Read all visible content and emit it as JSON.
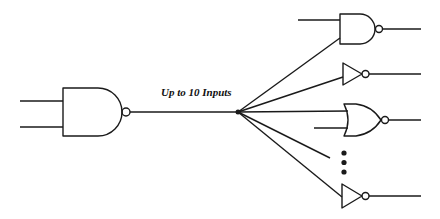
{
  "diagram": {
    "type": "logic-fanout",
    "label": "Up to 10 Inputs",
    "stroke_color": "#1a1a1a",
    "source_gate": {
      "kind": "NAND",
      "inputs": 2
    },
    "fanout_node": {
      "x": 238,
      "y": 112
    },
    "targets": [
      {
        "kind": "NAND",
        "inputs": 2
      },
      {
        "kind": "NOT",
        "inputs": 1
      },
      {
        "kind": "NOR",
        "inputs": 2
      },
      {
        "kind": "ellipsis",
        "symbol": "⋮"
      },
      {
        "kind": "NOT",
        "inputs": 1
      }
    ]
  }
}
